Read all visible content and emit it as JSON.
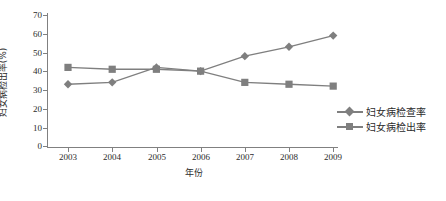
{
  "chart_data": {
    "type": "line",
    "title": "",
    "xlabel": "年份",
    "ylabel": "妇女病检出率(%)",
    "categories": [
      "2003",
      "2004",
      "2005",
      "2006",
      "2007",
      "2008",
      "2009"
    ],
    "series": [
      {
        "name": "妇女病检查率",
        "marker": "diamond",
        "color": "#7f7f7f",
        "values": [
          33,
          34,
          42,
          40,
          48,
          53,
          59
        ]
      },
      {
        "name": "妇女病检出率",
        "marker": "square",
        "color": "#7f7f7f",
        "values": [
          42,
          41,
          41,
          40,
          34,
          33,
          32
        ]
      }
    ],
    "ylim": [
      0,
      70
    ],
    "yticks": [
      0,
      10,
      20,
      30,
      40,
      50,
      60,
      70
    ],
    "grid": false,
    "legend_position": "right"
  },
  "axis": {
    "y_tick_labels": [
      "70",
      "60",
      "50",
      "40",
      "30",
      "20",
      "10",
      "0"
    ],
    "x_tick_labels": [
      "2003",
      "2004",
      "2005",
      "2006",
      "2007",
      "2008",
      "2009"
    ],
    "x_title": "年份",
    "y_title": "妇女病检出率(%)"
  },
  "legend": {
    "items": [
      {
        "label": "妇女病检查率",
        "marker": "diamond-marker-icon"
      },
      {
        "label": "妇女病检出率",
        "marker": "square-marker-icon"
      }
    ]
  }
}
